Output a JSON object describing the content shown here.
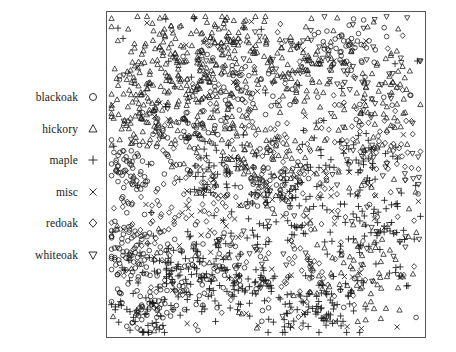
{
  "figure": {
    "type": "scatter-stem-map",
    "width": 456,
    "height": 352,
    "background": "#ffffff",
    "frame_color": "#555555",
    "marker_color": "#1a1a1a"
  },
  "legend": {
    "position": "left",
    "entries": [
      {
        "label": "blackoak",
        "marker": "circle-marker",
        "glyph": "○"
      },
      {
        "label": "hickory",
        "marker": "triangle-up-marker",
        "glyph": "△"
      },
      {
        "label": "maple",
        "marker": "plus-marker",
        "glyph": "+"
      },
      {
        "label": "misc",
        "marker": "cross-marker",
        "glyph": "×"
      },
      {
        "label": "redoak",
        "marker": "diamond-marker",
        "glyph": "◇"
      },
      {
        "label": "whiteoak",
        "marker": "triangle-down-marker",
        "glyph": "▽"
      }
    ]
  },
  "chart_data": {
    "type": "scatter",
    "title": "",
    "xlabel": "",
    "ylabel": "",
    "xlim": [
      0,
      1
    ],
    "ylim": [
      0,
      1
    ],
    "grid": false,
    "axis_ticks": false,
    "legend_position": "left-outside",
    "frame": true,
    "total_points": 2251,
    "series": [
      {
        "name": "blackoak",
        "marker": "circle",
        "count": 448,
        "density_hint": "clustered lower-left and mid-left bands, scattered elsewhere",
        "clusters": [
          {
            "cx": 0.06,
            "cy": 0.26,
            "rx": 0.09,
            "ry": 0.12,
            "n": 70
          },
          {
            "cx": 0.13,
            "cy": 0.1,
            "rx": 0.11,
            "ry": 0.09,
            "n": 58
          },
          {
            "cx": 0.3,
            "cy": 0.2,
            "rx": 0.13,
            "ry": 0.12,
            "n": 52
          },
          {
            "cx": 0.05,
            "cy": 0.52,
            "rx": 0.07,
            "ry": 0.1,
            "n": 46
          },
          {
            "cx": 0.52,
            "cy": 0.47,
            "rx": 0.12,
            "ry": 0.1,
            "n": 42
          },
          {
            "cx": 0.22,
            "cy": 0.62,
            "rx": 0.12,
            "ry": 0.12,
            "n": 40
          },
          {
            "cx": 0.74,
            "cy": 0.9,
            "rx": 0.12,
            "ry": 0.08,
            "n": 38
          },
          {
            "cx": 0.45,
            "cy": 0.75,
            "rx": 0.14,
            "ry": 0.11,
            "n": 36
          }
        ],
        "uniform": 66
      },
      {
        "name": "hickory",
        "marker": "triangle-up",
        "count": 703,
        "density_hint": "dominant across upper half, heaviest upper-left quadrant",
        "clusters": [
          {
            "cx": 0.18,
            "cy": 0.86,
            "rx": 0.17,
            "ry": 0.12,
            "n": 110
          },
          {
            "cx": 0.38,
            "cy": 0.9,
            "rx": 0.15,
            "ry": 0.1,
            "n": 92
          },
          {
            "cx": 0.09,
            "cy": 0.7,
            "rx": 0.1,
            "ry": 0.13,
            "n": 84
          },
          {
            "cx": 0.3,
            "cy": 0.68,
            "rx": 0.14,
            "ry": 0.12,
            "n": 76
          },
          {
            "cx": 0.62,
            "cy": 0.82,
            "rx": 0.15,
            "ry": 0.13,
            "n": 70
          },
          {
            "cx": 0.86,
            "cy": 0.72,
            "rx": 0.12,
            "ry": 0.15,
            "n": 64
          },
          {
            "cx": 0.5,
            "cy": 0.55,
            "rx": 0.16,
            "ry": 0.12,
            "n": 58
          },
          {
            "cx": 0.8,
            "cy": 0.18,
            "rx": 0.14,
            "ry": 0.13,
            "n": 52
          }
        ],
        "uniform": 97
      },
      {
        "name": "maple",
        "marker": "plus",
        "count": 514,
        "density_hint": "concentrated lower half and right-center, sparse upper-left",
        "clusters": [
          {
            "cx": 0.42,
            "cy": 0.14,
            "rx": 0.16,
            "ry": 0.12,
            "n": 84
          },
          {
            "cx": 0.66,
            "cy": 0.08,
            "rx": 0.15,
            "ry": 0.09,
            "n": 72
          },
          {
            "cx": 0.2,
            "cy": 0.22,
            "rx": 0.13,
            "ry": 0.12,
            "n": 62
          },
          {
            "cx": 0.58,
            "cy": 0.4,
            "rx": 0.15,
            "ry": 0.13,
            "n": 58
          },
          {
            "cx": 0.86,
            "cy": 0.3,
            "rx": 0.12,
            "ry": 0.14,
            "n": 54
          },
          {
            "cx": 0.36,
            "cy": 0.52,
            "rx": 0.14,
            "ry": 0.11,
            "n": 48
          },
          {
            "cx": 0.78,
            "cy": 0.56,
            "rx": 0.13,
            "ry": 0.12,
            "n": 44
          },
          {
            "cx": 0.1,
            "cy": 0.06,
            "rx": 0.09,
            "ry": 0.07,
            "n": 36
          }
        ],
        "uniform": 56
      },
      {
        "name": "misc",
        "marker": "cross",
        "count": 105,
        "density_hint": "sparse, scattered uniformly with slight right-side bias",
        "clusters": [
          {
            "cx": 0.72,
            "cy": 0.44,
            "rx": 0.18,
            "ry": 0.18,
            "n": 22
          },
          {
            "cx": 0.3,
            "cy": 0.3,
            "rx": 0.2,
            "ry": 0.18,
            "n": 18
          }
        ],
        "uniform": 65
      },
      {
        "name": "redoak",
        "marker": "diamond",
        "count": 346,
        "density_hint": "broad mid-field scatter, mild center and right clustering",
        "clusters": [
          {
            "cx": 0.54,
            "cy": 0.52,
            "rx": 0.17,
            "ry": 0.15,
            "n": 56
          },
          {
            "cx": 0.84,
            "cy": 0.62,
            "rx": 0.13,
            "ry": 0.15,
            "n": 48
          },
          {
            "cx": 0.26,
            "cy": 0.44,
            "rx": 0.15,
            "ry": 0.14,
            "n": 44
          },
          {
            "cx": 0.66,
            "cy": 0.2,
            "rx": 0.15,
            "ry": 0.13,
            "n": 40
          },
          {
            "cx": 0.4,
            "cy": 0.78,
            "rx": 0.14,
            "ry": 0.12,
            "n": 36
          },
          {
            "cx": 0.12,
            "cy": 0.34,
            "rx": 0.11,
            "ry": 0.13,
            "n": 32
          }
        ],
        "uniform": 90
      },
      {
        "name": "whiteoak",
        "marker": "triangle-down",
        "count": 135,
        "density_hint": "upper-right concentration, thinner toward lower-left",
        "clusters": [
          {
            "cx": 0.82,
            "cy": 0.8,
            "rx": 0.15,
            "ry": 0.14,
            "n": 34
          },
          {
            "cx": 0.6,
            "cy": 0.86,
            "rx": 0.14,
            "ry": 0.1,
            "n": 26
          },
          {
            "cx": 0.88,
            "cy": 0.4,
            "rx": 0.11,
            "ry": 0.16,
            "n": 22
          },
          {
            "cx": 0.48,
            "cy": 0.26,
            "rx": 0.16,
            "ry": 0.14,
            "n": 20
          }
        ],
        "uniform": 33
      }
    ]
  }
}
